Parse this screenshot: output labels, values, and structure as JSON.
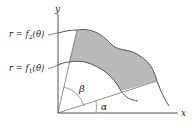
{
  "diagram": {
    "type": "polar-area-between-curves",
    "axes": {
      "x_label": "x",
      "y_label": "y"
    },
    "curves": [
      {
        "id": "outer",
        "label_lhs": "r = f",
        "label_sub": "2",
        "label_rhs": "(θ)"
      },
      {
        "id": "inner",
        "label_lhs": "r = f",
        "label_sub": "1",
        "label_rhs": "(θ)"
      }
    ],
    "angles": [
      {
        "id": "alpha",
        "symbol": "α"
      },
      {
        "id": "beta",
        "symbol": "β"
      }
    ],
    "colors": {
      "region_fill": "#b9b9b9",
      "axis": "#555555",
      "curve": "#555555",
      "ray": "#777777",
      "text": "#222222"
    }
  }
}
